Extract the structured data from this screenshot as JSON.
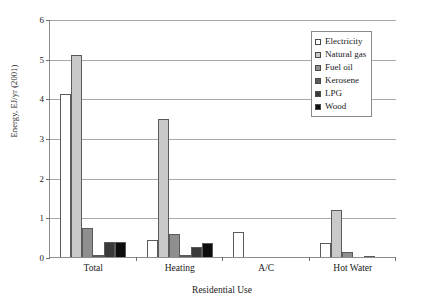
{
  "chart_data": {
    "type": "bar",
    "title": "",
    "xlabel": "Residential Use",
    "ylabel": "Energy, EJ/yr (2001)",
    "categories": [
      "Total",
      "Heating",
      "A/C",
      "Hot Water"
    ],
    "ylim": [
      0,
      6
    ],
    "yticks": [
      0,
      1,
      2,
      3,
      4,
      5,
      6
    ],
    "ytick_labels": [
      "0",
      "1",
      "2",
      "3",
      "4",
      "5",
      "6"
    ],
    "grid": true,
    "legend_position": "top-right",
    "series": [
      {
        "name": "Electricity",
        "color": "#ffffff",
        "values": [
          4.1,
          0.42,
          0.62,
          0.35
        ]
      },
      {
        "name": "Natural gas",
        "color": "#c9c9c9",
        "values": [
          5.1,
          3.48,
          0.0,
          1.18
        ]
      },
      {
        "name": "Fuel oil",
        "color": "#8f8f8f",
        "values": [
          0.74,
          0.58,
          0.0,
          0.12
        ]
      },
      {
        "name": "Kerosene",
        "color": "#5c5c5c",
        "values": [
          0.06,
          0.06,
          0.0,
          0.0
        ]
      },
      {
        "name": "LPG",
        "color": "#3a3a3a",
        "values": [
          0.38,
          0.26,
          0.0,
          0.03
        ]
      },
      {
        "name": "Wood",
        "color": "#0d0d0d",
        "values": [
          0.39,
          0.36,
          0.0,
          0.0
        ]
      }
    ]
  },
  "legend": {
    "items": [
      {
        "label": "Electricity",
        "color": "#ffffff"
      },
      {
        "label": "Natural gas",
        "color": "#c9c9c9"
      },
      {
        "label": "Fuel oil",
        "color": "#8f8f8f"
      },
      {
        "label": "Kerosene",
        "color": "#5c5c5c"
      },
      {
        "label": "LPG",
        "color": "#3a3a3a"
      },
      {
        "label": "Wood",
        "color": "#0d0d0d"
      }
    ]
  },
  "axes": {
    "y_title": "Energy, EJ/yr (2001)",
    "x_title": "Residential Use"
  }
}
